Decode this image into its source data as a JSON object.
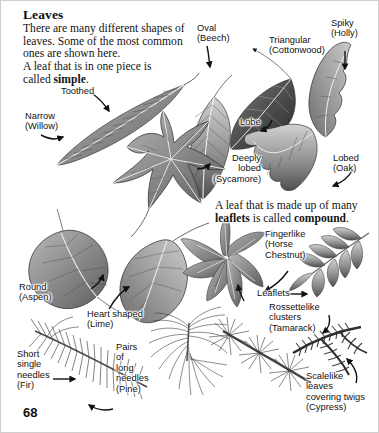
{
  "page": {
    "title": "Leaves",
    "page_number": "68",
    "background_color": "#ffffff",
    "text_color": "#111111"
  },
  "intro": {
    "paragraph_1": "There are many different shapes of\nleaves. Some of the most common\nones are shown here.",
    "paragraph_2_part1": "A leaf that is in one piece is\ncalled ",
    "paragraph_2_bold": "simple",
    "paragraph_2_end": "."
  },
  "compound_note": {
    "line1": "A leaf that is made up of many",
    "line2_bold1": "leaflets",
    "line2_mid": " is called ",
    "line2_bold2": "compound",
    "line2_end": "."
  },
  "labels": [
    {
      "id": "toothed",
      "text": "Toothed"
    },
    {
      "id": "narrow-willow",
      "text": "Narrow\n(Willow)"
    },
    {
      "id": "oval-beech",
      "text": "Oval\n(Beech)"
    },
    {
      "id": "triangular-cottonwood",
      "text": "Triangular\n(Cottonwood)"
    },
    {
      "id": "spiky-holly",
      "text": "Spiky\n(Holly)"
    },
    {
      "id": "lobe",
      "text": "Lobe"
    },
    {
      "id": "deeply-lobed-sycamore",
      "text": "Deeply\nlobed\n(Sycamore)"
    },
    {
      "id": "lobed-oak",
      "text": "Lobed\n(Oak)"
    },
    {
      "id": "round-aspen",
      "text": "Round\n(Aspen)"
    },
    {
      "id": "heart-shaped-lime",
      "text": "Heart shaped\n(Lime)"
    },
    {
      "id": "fingerlike-horse-chestnut",
      "text": "Fingerlike\n(Horse\nChestnut)"
    },
    {
      "id": "leaflets",
      "text": "Leaflets"
    },
    {
      "id": "rossettelike-tamarack",
      "text": "Rossettelike\nclusters\n(Tamarack)"
    },
    {
      "id": "short-single-needles-fir",
      "text": "Short\nsingle\nneedles\n(Fir)"
    },
    {
      "id": "pairs-long-needles-pine",
      "text": "Pairs\nof\nlong\nneedles\n(Pine)"
    },
    {
      "id": "scalelike-cypress",
      "text": "Scalelike\nleaves\ncovering twigs\n(Cypress)"
    }
  ],
  "illustrations": [
    {
      "id": "willow-leaf",
      "caption": "Narrow (Willow) — long toothed leaf"
    },
    {
      "id": "beech-leaf",
      "caption": "Oval (Beech) leaf"
    },
    {
      "id": "cottonwood-leaf",
      "caption": "Triangular (Cottonwood) leaf"
    },
    {
      "id": "holly-leaf",
      "caption": "Spiky (Holly) leaf"
    },
    {
      "id": "sycamore-leaf",
      "caption": "Deeply lobed (Sycamore) leaf"
    },
    {
      "id": "oak-leaf",
      "caption": "Lobed (Oak) leaf"
    },
    {
      "id": "aspen-leaf",
      "caption": "Round (Aspen) leaf"
    },
    {
      "id": "lime-leaf",
      "caption": "Heart shaped (Lime) leaf"
    },
    {
      "id": "horse-chestnut-leaf",
      "caption": "Fingerlike (Horse Chestnut) compound leaf"
    },
    {
      "id": "ash-compound-leaf",
      "caption": "Pinnate compound leaf with leaflets"
    },
    {
      "id": "fir-branch",
      "caption": "Short single needles (Fir)"
    },
    {
      "id": "pine-branch",
      "caption": "Pairs of long needles (Pine)"
    },
    {
      "id": "tamarack-branch",
      "caption": "Rossettelike clusters (Tamarack)"
    },
    {
      "id": "cypress-twig",
      "caption": "Scalelike leaves covering twigs (Cypress)"
    }
  ]
}
